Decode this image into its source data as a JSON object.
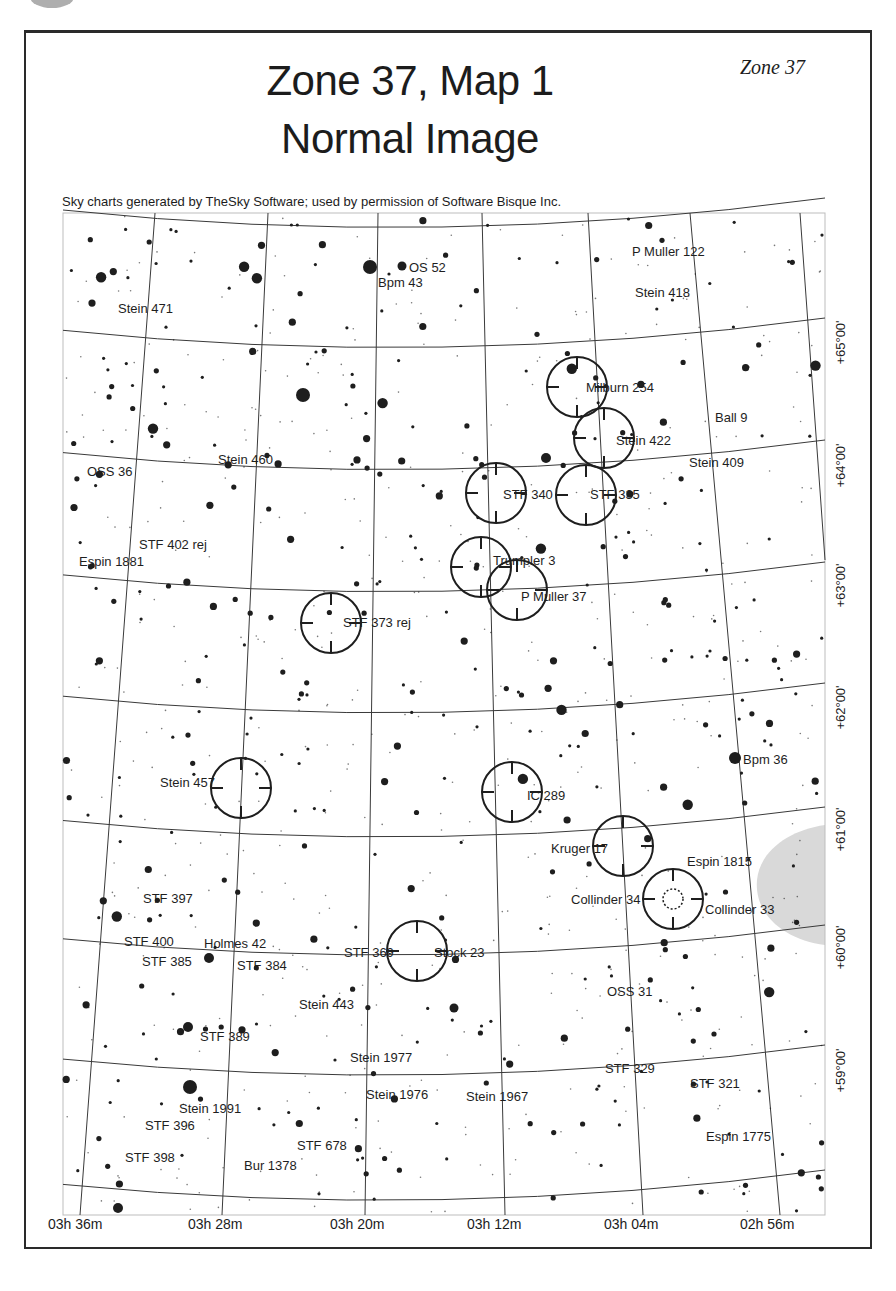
{
  "page": {
    "title_line1": "Zone 37, Map 1",
    "title_line2": "Normal Image",
    "zone_tag": "Zone 37",
    "credit": "Sky charts generated by TheSky Software; used by permission of Software Bisque Inc."
  },
  "axes": {
    "ra_labels": [
      {
        "text": "03h 36m",
        "x": 48
      },
      {
        "text": "03h 28m",
        "x": 188
      },
      {
        "text": "03h 20m",
        "x": 330
      },
      {
        "text": "03h 12m",
        "x": 467
      },
      {
        "text": "03h 04m",
        "x": 604
      },
      {
        "text": "02h 56m",
        "x": 740
      }
    ],
    "dec_labels": [
      {
        "text": "+65°00'",
        "y": 335
      },
      {
        "text": "+64°00'",
        "y": 458
      },
      {
        "text": "+63°00'",
        "y": 578
      },
      {
        "text": "+62°00'",
        "y": 700
      },
      {
        "text": "+61°00'",
        "y": 822
      },
      {
        "text": "+60°00'",
        "y": 940
      },
      {
        "text": "+59°00'",
        "y": 1063
      }
    ]
  },
  "colors": {
    "ink": "#1e1e1e",
    "grid": "#3a3a3a",
    "nebula_shade": "#d9d9d9",
    "background": "#ffffff"
  },
  "objects": [
    {
      "name": "OS 52",
      "lx": 409,
      "ly": 272,
      "circle": false
    },
    {
      "name": "Bpm 43",
      "lx": 378,
      "ly": 287,
      "circle": false
    },
    {
      "name": "P Muller 122",
      "lx": 632,
      "ly": 256,
      "circle": false
    },
    {
      "name": "Stein 471",
      "lx": 118,
      "ly": 313,
      "circle": false
    },
    {
      "name": "Stein 418",
      "lx": 635,
      "ly": 297,
      "circle": false
    },
    {
      "name": "Milburn 254",
      "lx": 586,
      "ly": 392,
      "circle": true,
      "cx": 577,
      "cy": 387
    },
    {
      "name": "Ball 9",
      "lx": 715,
      "ly": 422,
      "circle": false
    },
    {
      "name": "Stein 422",
      "lx": 616,
      "ly": 445,
      "circle": true,
      "cx": 604,
      "cy": 438
    },
    {
      "name": "Stein 460",
      "lx": 218,
      "ly": 464,
      "circle": false
    },
    {
      "name": "Stein 409",
      "lx": 689,
      "ly": 467,
      "circle": false
    },
    {
      "name": "OSS 36",
      "lx": 87,
      "ly": 476,
      "circle": false
    },
    {
      "name": "STF 340",
      "lx": 503,
      "ly": 499,
      "circle": true,
      "cx": 496,
      "cy": 493
    },
    {
      "name": "STF 335",
      "lx": 590,
      "ly": 499,
      "circle": true,
      "cx": 586,
      "cy": 495
    },
    {
      "name": "STF 402 rej",
      "lx": 139,
      "ly": 549,
      "circle": false
    },
    {
      "name": "Espin 1881",
      "lx": 79,
      "ly": 566,
      "circle": false
    },
    {
      "name": "Trumpler 3",
      "lx": 493,
      "ly": 565,
      "circle": true,
      "cx": 481,
      "cy": 567
    },
    {
      "name": "P Muller 37",
      "lx": 521,
      "ly": 601,
      "circle": true,
      "cx": 517,
      "cy": 590
    },
    {
      "name": "STF 373 rej",
      "lx": 343,
      "ly": 627,
      "circle": true,
      "cx": 331,
      "cy": 623
    },
    {
      "name": "Bpm 36",
      "lx": 743,
      "ly": 764,
      "circle": false
    },
    {
      "name": "Stein 457",
      "lx": 160,
      "ly": 787,
      "circle": true,
      "cx": 241,
      "cy": 788
    },
    {
      "name": "IC 289",
      "lx": 527,
      "ly": 800,
      "circle": true,
      "cx": 512,
      "cy": 792
    },
    {
      "name": "Kruger 17",
      "lx": 551,
      "ly": 853,
      "circle": true,
      "cx": 623,
      "cy": 846
    },
    {
      "name": "Espin 1815",
      "lx": 687,
      "ly": 866,
      "circle": false
    },
    {
      "name": "STF 397",
      "lx": 143,
      "ly": 903,
      "circle": false
    },
    {
      "name": "Collinder 34",
      "lx": 571,
      "ly": 904,
      "circle": false
    },
    {
      "name": "Collinder 33",
      "lx": 705,
      "ly": 914,
      "circle": true,
      "cx": 673,
      "cy": 899
    },
    {
      "name": "STF 400",
      "lx": 124,
      "ly": 946,
      "circle": false
    },
    {
      "name": "Holmes 42",
      "lx": 204,
      "ly": 948,
      "circle": false
    },
    {
      "name": "STF 369",
      "lx": 344,
      "ly": 957,
      "circle": false
    },
    {
      "name": "Stock 23",
      "lx": 434,
      "ly": 957,
      "circle": true,
      "cx": 417,
      "cy": 951
    },
    {
      "name": "STF 385",
      "lx": 142,
      "ly": 966,
      "circle": false
    },
    {
      "name": "STF 384",
      "lx": 237,
      "ly": 970,
      "circle": false
    },
    {
      "name": "OSS 31",
      "lx": 607,
      "ly": 996,
      "circle": false
    },
    {
      "name": "Stein 443",
      "lx": 299,
      "ly": 1009,
      "circle": false
    },
    {
      "name": "STF 389",
      "lx": 200,
      "ly": 1041,
      "circle": false
    },
    {
      "name": "Stein 1977",
      "lx": 350,
      "ly": 1062,
      "circle": false
    },
    {
      "name": "STF 329",
      "lx": 605,
      "ly": 1073,
      "circle": false
    },
    {
      "name": "STF 321",
      "lx": 690,
      "ly": 1088,
      "circle": false
    },
    {
      "name": "Stein 1976",
      "lx": 366,
      "ly": 1099,
      "circle": false
    },
    {
      "name": "Stein 1967",
      "lx": 466,
      "ly": 1101,
      "circle": false
    },
    {
      "name": "Stein 1991",
      "lx": 179,
      "ly": 1113,
      "circle": false
    },
    {
      "name": "STF 396",
      "lx": 145,
      "ly": 1130,
      "circle": false
    },
    {
      "name": "Espin 1775",
      "lx": 706,
      "ly": 1141,
      "circle": false
    },
    {
      "name": "STF 678",
      "lx": 297,
      "ly": 1150,
      "circle": false
    },
    {
      "name": "STF 398",
      "lx": 125,
      "ly": 1162,
      "circle": false
    },
    {
      "name": "Bur 1378",
      "lx": 244,
      "ly": 1170,
      "circle": false
    }
  ]
}
